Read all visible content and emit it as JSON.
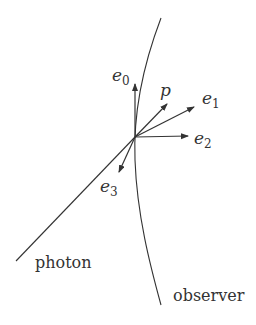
{
  "diagram": {
    "colors": {
      "stroke": "#333333",
      "text": "#333333",
      "background": "#ffffff"
    },
    "origin": {
      "x": 135,
      "y": 137
    },
    "curves": {
      "observer": {
        "label": "observer",
        "label_pos": {
          "x": 173,
          "y": 301
        }
      },
      "photon": {
        "label": "photon",
        "label_pos": {
          "x": 35,
          "y": 268
        }
      }
    },
    "vectors": [
      {
        "id": "e0",
        "base": "e",
        "sub": "0",
        "tip": {
          "x": 135,
          "y": 84
        },
        "label_pos": {
          "x": 112,
          "y": 81
        }
      },
      {
        "id": "p",
        "base": "p",
        "sub": "",
        "tip": {
          "x": 167,
          "y": 104
        },
        "label_pos": {
          "x": 160,
          "y": 96
        }
      },
      {
        "id": "e1",
        "base": "e",
        "sub": "1",
        "tip": {
          "x": 194,
          "y": 107
        },
        "label_pos": {
          "x": 202,
          "y": 104
        }
      },
      {
        "id": "e2",
        "base": "e",
        "sub": "2",
        "tip": {
          "x": 188,
          "y": 136
        },
        "label_pos": {
          "x": 194,
          "y": 144
        }
      },
      {
        "id": "e3",
        "base": "e",
        "sub": "3",
        "tip": {
          "x": 119,
          "y": 172
        },
        "label_pos": {
          "x": 100,
          "y": 192
        }
      }
    ]
  }
}
